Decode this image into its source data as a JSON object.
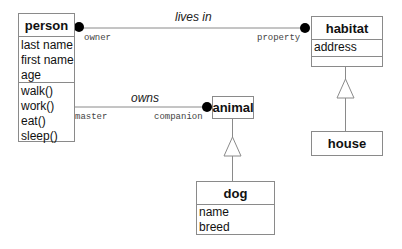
{
  "diagram": {
    "type": "UML class diagram",
    "classes": {
      "person": {
        "name": "person",
        "attributes": [
          "last name",
          "first name",
          "age"
        ],
        "methods": [
          "walk()",
          "work()",
          "eat()",
          "sleep()"
        ]
      },
      "habitat": {
        "name": "habitat",
        "attributes": [
          "address"
        ],
        "methods": []
      },
      "house": {
        "name": "house"
      },
      "animal": {
        "name": "animal"
      },
      "dog": {
        "name": "dog",
        "attributes": [
          "name",
          "breed"
        ]
      }
    },
    "associations": {
      "lives_in": {
        "label": "lives in",
        "from_role": "owner",
        "to_role": "property",
        "from": "person",
        "to": "habitat"
      },
      "owns": {
        "label": "owns",
        "from_role": "master",
        "to_role": "companion",
        "from": "person",
        "to": "animal"
      }
    },
    "generalizations": [
      {
        "child": "house",
        "parent": "habitat"
      },
      {
        "child": "dog",
        "parent": "animal"
      }
    ]
  }
}
